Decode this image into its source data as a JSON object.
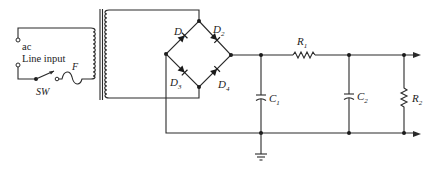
{
  "diagram": {
    "type": "full-wave bridge rectifier power supply with pi filter",
    "colors": {
      "ink": "#2a2a2a",
      "background": "#ffffff"
    },
    "labels": {
      "ac": "ac",
      "line_input": "Line input",
      "switch": "SW",
      "fuse": "F",
      "d1": "D",
      "d1_sub": "1",
      "d2": "D",
      "d2_sub": "2",
      "d3": "D",
      "d3_sub": "3",
      "d4": "D",
      "d4_sub": "4",
      "c1": "C",
      "c1_sub": "1",
      "c2": "C",
      "c2_sub": "2",
      "r1": "R",
      "r1_sub": "1",
      "r2": "R",
      "r2_sub": "2"
    },
    "components": [
      {
        "id": "ac-input",
        "kind": "terminal-pair",
        "label": "ac Line input"
      },
      {
        "id": "SW",
        "kind": "switch"
      },
      {
        "id": "F",
        "kind": "fuse"
      },
      {
        "id": "T1",
        "kind": "transformer"
      },
      {
        "id": "D1",
        "kind": "diode"
      },
      {
        "id": "D2",
        "kind": "diode"
      },
      {
        "id": "D3",
        "kind": "diode"
      },
      {
        "id": "D4",
        "kind": "diode"
      },
      {
        "id": "C1",
        "kind": "capacitor"
      },
      {
        "id": "R1",
        "kind": "resistor"
      },
      {
        "id": "C2",
        "kind": "capacitor"
      },
      {
        "id": "R2",
        "kind": "resistor",
        "role": "load"
      },
      {
        "id": "GND",
        "kind": "ground"
      }
    ]
  }
}
